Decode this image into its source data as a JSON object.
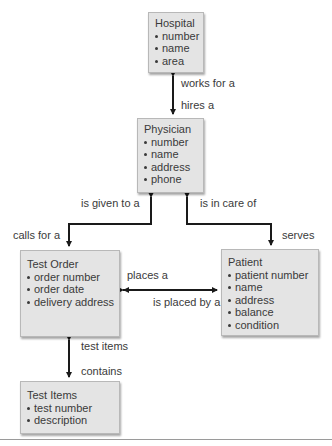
{
  "diagram": {
    "type": "entity-relationship",
    "entities": [
      {
        "id": "hospital",
        "title": "Hospital",
        "attributes": [
          "number",
          "name",
          "area"
        ]
      },
      {
        "id": "physician",
        "title": "Physician",
        "attributes": [
          "number",
          "name",
          "address",
          "phone"
        ]
      },
      {
        "id": "test_order",
        "title": "Test Order",
        "attributes": [
          "order number",
          "order date",
          "delivery address"
        ]
      },
      {
        "id": "patient",
        "title": "Patient",
        "attributes": [
          "patient number",
          "name",
          "address",
          "balance",
          "condition"
        ]
      },
      {
        "id": "test_items",
        "title": "Test Items",
        "attributes": [
          "test number",
          "description"
        ]
      }
    ],
    "relationships": [
      {
        "from": "hospital",
        "to": "physician",
        "forward_label": "works for a",
        "reverse_label": "hires a"
      },
      {
        "from": "physician",
        "to": "test_order",
        "forward_label": "is given to a",
        "reverse_label": "calls for a"
      },
      {
        "from": "physician",
        "to": "patient",
        "forward_label": "is in care of",
        "reverse_label": "serves"
      },
      {
        "from": "patient",
        "to": "test_order",
        "forward_label": "places a",
        "reverse_label": "is placed by a"
      },
      {
        "from": "test_order",
        "to": "test_items",
        "forward_label": "test items",
        "reverse_label": "contains"
      }
    ]
  },
  "colors": {
    "box_fill": "#e4e4e4",
    "box_border": "#b8b8b8",
    "line": "#1a1a1a",
    "text": "#3a3a3a"
  }
}
